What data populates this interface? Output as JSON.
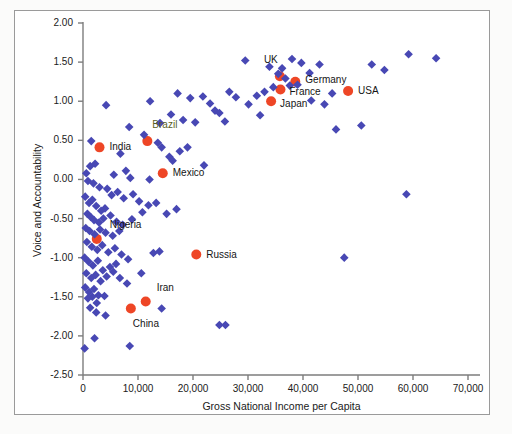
{
  "chart_data": {
    "type": "scatter",
    "title": "",
    "xlabel": "Gross National Income per Capita",
    "ylabel": "Voice and Accountability",
    "xlim": [
      0,
      70000
    ],
    "ylim": [
      -2.5,
      2.0
    ],
    "xticks": [
      0,
      10000,
      20000,
      30000,
      40000,
      50000,
      60000,
      70000
    ],
    "xtick_labels": [
      "0",
      "10,000",
      "20,000",
      "30,000",
      "40,000",
      "50,000",
      "60,000",
      "70,000"
    ],
    "yticks": [
      2.0,
      1.5,
      1.0,
      0.5,
      0.0,
      -0.5,
      -1.0,
      -1.5,
      -2.0,
      -2.5
    ],
    "ytick_labels": [
      "2.00",
      "1.50",
      "1.00",
      "0.50",
      "0.00",
      "-0.50",
      "-1.00",
      "-1.50",
      "-2.00",
      "-2.50"
    ],
    "grid": false,
    "legend": "none",
    "colors": {
      "other_countries": "#4848b4",
      "highlighted_countries": "#ee4626",
      "axis": "#7d7d7d",
      "text": "#1a1a1a",
      "frame": "#9a9a9a"
    },
    "series": [
      {
        "name": "Highlighted countries",
        "marker": "circle",
        "color": "#ee4626",
        "points": [
          {
            "label": "UK",
            "x": 35800,
            "y": 1.32,
            "label_dx": -16,
            "label_dy": -16
          },
          {
            "label": "Germany",
            "x": 38600,
            "y": 1.25,
            "label_dx": 10,
            "label_dy": -2
          },
          {
            "label": "France",
            "x": 35900,
            "y": 1.15,
            "label_dx": 9,
            "label_dy": 3
          },
          {
            "label": "Japan",
            "x": 34200,
            "y": 1.0,
            "label_dx": 9,
            "label_dy": 3
          },
          {
            "label": "USA",
            "x": 48200,
            "y": 1.13,
            "label_dx": 10,
            "label_dy": 0
          },
          {
            "label": "Brazil",
            "x": 11700,
            "y": 0.49,
            "label_dx": 5,
            "label_dy": -16
          },
          {
            "label": "India",
            "x": 3000,
            "y": 0.41,
            "label_dx": 10,
            "label_dy": 0
          },
          {
            "label": "Mexico",
            "x": 14500,
            "y": 0.08,
            "label_dx": 10,
            "label_dy": 0
          },
          {
            "label": "Nigeria",
            "x": 2500,
            "y": -0.76,
            "label_dx": 13,
            "label_dy": -14
          },
          {
            "label": "Russia",
            "x": 20600,
            "y": -0.96,
            "label_dx": 10,
            "label_dy": 0
          },
          {
            "label": "Iran",
            "x": 11400,
            "y": -1.56,
            "label_dx": 11,
            "label_dy": -13
          },
          {
            "label": "China",
            "x": 8700,
            "y": -1.65,
            "label_dx": 2,
            "label_dy": 15
          }
        ]
      },
      {
        "name": "Other countries",
        "marker": "diamond",
        "color": "#4848b4",
        "points": [
          {
            "x": 29500,
            "y": 1.52
          },
          {
            "x": 33900,
            "y": 1.44
          },
          {
            "x": 38000,
            "y": 1.54
          },
          {
            "x": 39700,
            "y": 1.49
          },
          {
            "x": 41200,
            "y": 1.36
          },
          {
            "x": 43000,
            "y": 1.47
          },
          {
            "x": 52500,
            "y": 1.47
          },
          {
            "x": 54800,
            "y": 1.4
          },
          {
            "x": 59200,
            "y": 1.6
          },
          {
            "x": 64200,
            "y": 1.55
          },
          {
            "x": 26600,
            "y": 1.12
          },
          {
            "x": 27800,
            "y": 1.05
          },
          {
            "x": 31600,
            "y": 1.07
          },
          {
            "x": 33000,
            "y": 1.12
          },
          {
            "x": 35500,
            "y": 1.35
          },
          {
            "x": 36800,
            "y": 1.29
          },
          {
            "x": 37600,
            "y": 1.2
          },
          {
            "x": 39000,
            "y": 1.21
          },
          {
            "x": 34600,
            "y": 1.18
          },
          {
            "x": 36200,
            "y": 1.42
          },
          {
            "x": 30100,
            "y": 0.96
          },
          {
            "x": 32200,
            "y": 0.82
          },
          {
            "x": 41500,
            "y": 1.01
          },
          {
            "x": 43900,
            "y": 0.96
          },
          {
            "x": 45300,
            "y": 1.1
          },
          {
            "x": 46000,
            "y": 0.64
          },
          {
            "x": 50600,
            "y": 0.69
          },
          {
            "x": 4200,
            "y": 0.95
          },
          {
            "x": 12200,
            "y": 1.0
          },
          {
            "x": 17200,
            "y": 1.1
          },
          {
            "x": 19500,
            "y": 1.04
          },
          {
            "x": 21800,
            "y": 1.06
          },
          {
            "x": 23100,
            "y": 0.97
          },
          {
            "x": 24000,
            "y": 0.88
          },
          {
            "x": 24800,
            "y": 0.85
          },
          {
            "x": 25800,
            "y": 0.74
          },
          {
            "x": 18200,
            "y": 0.76
          },
          {
            "x": 16000,
            "y": 0.83
          },
          {
            "x": 14000,
            "y": 0.72
          },
          {
            "x": 8400,
            "y": 0.67
          },
          {
            "x": 11100,
            "y": 0.57
          },
          {
            "x": 13600,
            "y": 0.47
          },
          {
            "x": 14300,
            "y": 0.41
          },
          {
            "x": 15700,
            "y": 0.29
          },
          {
            "x": 17600,
            "y": 0.36
          },
          {
            "x": 19000,
            "y": 0.41
          },
          {
            "x": 20400,
            "y": 0.73
          },
          {
            "x": 22000,
            "y": 0.18
          },
          {
            "x": 1500,
            "y": 0.49
          },
          {
            "x": 6800,
            "y": 0.33
          },
          {
            "x": 1300,
            "y": 0.17
          },
          {
            "x": 2200,
            "y": 0.2
          },
          {
            "x": 5600,
            "y": 0.06
          },
          {
            "x": 7800,
            "y": 0.11
          },
          {
            "x": 8600,
            "y": 0.02
          },
          {
            "x": 12100,
            "y": 0.0
          },
          {
            "x": 16300,
            "y": 0.24
          },
          {
            "x": 600,
            "y": 0.08
          },
          {
            "x": 900,
            "y": -0.02
          },
          {
            "x": 1900,
            "y": -0.05
          },
          {
            "x": 3000,
            "y": -0.1
          },
          {
            "x": 4400,
            "y": -0.12
          },
          {
            "x": 5200,
            "y": -0.2
          },
          {
            "x": 6300,
            "y": -0.16
          },
          {
            "x": 7400,
            "y": -0.24
          },
          {
            "x": 9100,
            "y": -0.19
          },
          {
            "x": 10200,
            "y": -0.28
          },
          {
            "x": 11900,
            "y": -0.33
          },
          {
            "x": 13300,
            "y": -0.3
          },
          {
            "x": 400,
            "y": -0.22
          },
          {
            "x": 1100,
            "y": -0.3
          },
          {
            "x": 1700,
            "y": -0.26
          },
          {
            "x": 2400,
            "y": -0.34
          },
          {
            "x": 3300,
            "y": -0.4
          },
          {
            "x": 4000,
            "y": -0.37
          },
          {
            "x": 800,
            "y": -0.44
          },
          {
            "x": 1400,
            "y": -0.48
          },
          {
            "x": 2000,
            "y": -0.52
          },
          {
            "x": 2900,
            "y": -0.55
          },
          {
            "x": 3700,
            "y": -0.5
          },
          {
            "x": 5000,
            "y": -0.46
          },
          {
            "x": 6100,
            "y": -0.54
          },
          {
            "x": 7200,
            "y": -0.58
          },
          {
            "x": 8900,
            "y": -0.51
          },
          {
            "x": 10800,
            "y": -0.42
          },
          {
            "x": 15200,
            "y": -0.44
          },
          {
            "x": 17000,
            "y": -0.38
          },
          {
            "x": 500,
            "y": -0.62
          },
          {
            "x": 1200,
            "y": -0.66
          },
          {
            "x": 2100,
            "y": -0.7
          },
          {
            "x": 3100,
            "y": -0.64
          },
          {
            "x": 4100,
            "y": -0.68
          },
          {
            "x": 5400,
            "y": -0.72
          },
          {
            "x": 6600,
            "y": -0.66
          },
          {
            "x": 700,
            "y": -0.8
          },
          {
            "x": 1600,
            "y": -0.86
          },
          {
            "x": 2600,
            "y": -0.9
          },
          {
            "x": 3500,
            "y": -0.84
          },
          {
            "x": 4600,
            "y": -0.93
          },
          {
            "x": 5800,
            "y": -0.88
          },
          {
            "x": 7000,
            "y": -0.96
          },
          {
            "x": 8200,
            "y": -1.02
          },
          {
            "x": 12800,
            "y": -0.94
          },
          {
            "x": 13900,
            "y": -0.92
          },
          {
            "x": 300,
            "y": -1.0
          },
          {
            "x": 1000,
            "y": -1.05
          },
          {
            "x": 1800,
            "y": -1.1
          },
          {
            "x": 2700,
            "y": -1.04
          },
          {
            "x": 3600,
            "y": -1.16
          },
          {
            "x": 4900,
            "y": -1.12
          },
          {
            "x": 6000,
            "y": -1.08
          },
          {
            "x": 600,
            "y": -1.2
          },
          {
            "x": 1500,
            "y": -1.26
          },
          {
            "x": 2300,
            "y": -1.22
          },
          {
            "x": 3200,
            "y": -1.3
          },
          {
            "x": 4300,
            "y": -1.24
          },
          {
            "x": 5500,
            "y": -1.18
          },
          {
            "x": 6700,
            "y": -1.26
          },
          {
            "x": 8000,
            "y": -1.33
          },
          {
            "x": 10600,
            "y": -1.2
          },
          {
            "x": 400,
            "y": -1.38
          },
          {
            "x": 1100,
            "y": -1.44
          },
          {
            "x": 2000,
            "y": -1.4
          },
          {
            "x": 2800,
            "y": -1.48
          },
          {
            "x": 900,
            "y": -1.52
          },
          {
            "x": 1700,
            "y": -1.5
          },
          {
            "x": 2500,
            "y": -1.58
          },
          {
            "x": 3900,
            "y": -1.49
          },
          {
            "x": 14300,
            "y": -1.65
          },
          {
            "x": 2400,
            "y": -1.7
          },
          {
            "x": 1300,
            "y": -1.64
          },
          {
            "x": 4100,
            "y": -1.74
          },
          {
            "x": 24800,
            "y": -1.86
          },
          {
            "x": 25900,
            "y": -1.86
          },
          {
            "x": 2100,
            "y": -2.03
          },
          {
            "x": 8500,
            "y": -2.13
          },
          {
            "x": 300,
            "y": -2.16
          },
          {
            "x": 47500,
            "y": -1.0
          },
          {
            "x": 58800,
            "y": -0.19
          }
        ]
      }
    ]
  },
  "axis": {
    "x_title": "Gross National Income per Capita",
    "y_title": "Voice and Accountability"
  }
}
